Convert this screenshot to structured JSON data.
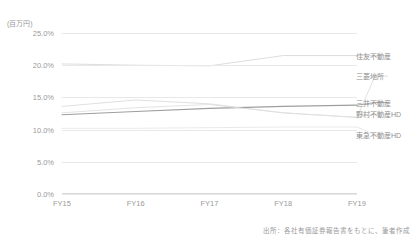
{
  "unit_label": "(百万円)",
  "source_note": "出所：各社有価証券報告書をもとに、筆者作成",
  "axis": {
    "y_ticks": [
      "0.0%",
      "5.0%",
      "10.0%",
      "15.0%",
      "20.0%",
      "25.0%"
    ],
    "x_ticks": [
      "FY15",
      "FY16",
      "FY17",
      "FY18",
      "FY19"
    ]
  },
  "series_labels": {
    "s0": "住友不動産",
    "s1": "三菱地所",
    "s2": "三井不動産",
    "s3": "野村不動産HD",
    "s4": "東急不動産HD"
  },
  "chart_data": {
    "type": "line",
    "title": "",
    "xlabel": "",
    "ylabel": "(百万円)",
    "ylim": [
      0,
      25
    ],
    "ytick_step": 5,
    "yunit": "%",
    "grid": true,
    "legend_position": "right-inline",
    "categories": [
      "FY15",
      "FY16",
      "FY17",
      "FY18",
      "FY19"
    ],
    "series": [
      {
        "name": "住友不動産",
        "values": [
          20.2,
          20.0,
          19.9,
          21.5,
          21.5
        ],
        "color": "#d9d9d9",
        "label_y": 21.5
      },
      {
        "name": "三菱地所",
        "values": [
          13.6,
          14.6,
          14.0,
          12.6,
          11.9
        ],
        "color": "#dcdcdc",
        "label_y": 18.3
      },
      {
        "name": "三井不動産",
        "values": [
          12.3,
          12.8,
          13.3,
          13.6,
          13.8
        ],
        "color": "#9e9e9e",
        "label_y": 14.2
      },
      {
        "name": "野村不動産HD",
        "values": [
          12.6,
          13.4,
          13.9,
          12.6,
          11.9
        ],
        "color": "#e0e0e0",
        "label_y": 12.4
      },
      {
        "name": "東急不動産HD",
        "values": [
          10.2,
          10.2,
          10.3,
          10.4,
          10.4
        ],
        "color": "#e6e6e6",
        "label_y": 9.2
      }
    ],
    "source": "出所：各社有価証券報告書をもとに、筆者作成"
  }
}
